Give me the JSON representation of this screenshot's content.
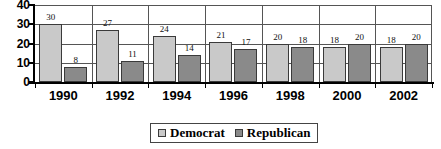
{
  "chart_data": {
    "type": "bar",
    "title": "",
    "subtitle": "",
    "xlabel": "",
    "ylabel": "",
    "categories": [
      "1990",
      "1992",
      "1994",
      "1996",
      "1998",
      "2000",
      "2002"
    ],
    "series": [
      {
        "name": "Democrat",
        "color": "#c9c9c9",
        "values": [
          30,
          27,
          24,
          21,
          20,
          18,
          18
        ]
      },
      {
        "name": "Republican",
        "color": "#8a8a8a",
        "values": [
          8,
          11,
          14,
          17,
          18,
          20,
          20
        ]
      }
    ],
    "ylim": [
      0,
      40
    ],
    "y_ticks": [
      0,
      10,
      20,
      30,
      40
    ],
    "y_tick_labels": [
      "0",
      "10",
      "20",
      "30",
      "40"
    ],
    "grid": true,
    "data_labels": true,
    "legend_position": "bottom"
  },
  "legend": {
    "items": [
      {
        "label": "Democrat",
        "swatch": "dem"
      },
      {
        "label": "Republican",
        "swatch": "rep"
      }
    ]
  }
}
